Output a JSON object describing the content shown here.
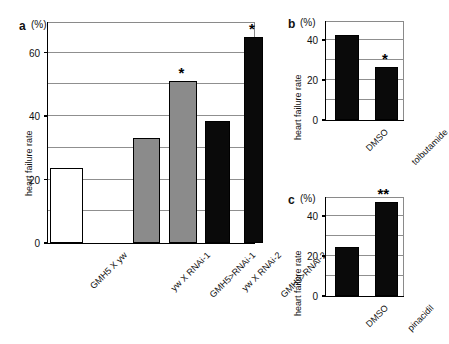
{
  "figure": {
    "panels": [
      {
        "letter": "a",
        "unit": "(%)",
        "ylabel": "heart failure rate",
        "yticks": [
          "0",
          "20",
          "40",
          "60"
        ],
        "bars": [
          {
            "label": "GMH5 X yw",
            "value": 23.5,
            "fill": "white",
            "marker": ""
          },
          {
            "label": "yw X RNAi-1",
            "value": 33.0,
            "fill": "gray",
            "marker": ""
          },
          {
            "label": "GMH5>RNAi-1",
            "value": 51.0,
            "fill": "gray",
            "marker": "*"
          },
          {
            "label": "yw X RNAi-2",
            "value": 38.5,
            "fill": "black",
            "marker": ""
          },
          {
            "label": "GMH5>RNAi-2",
            "value": 65.0,
            "fill": "black",
            "marker": "*"
          }
        ]
      },
      {
        "letter": "b",
        "unit": "(%)",
        "ylabel": "heart failure rate",
        "yticks": [
          "0",
          "20",
          "40"
        ],
        "bars": [
          {
            "label": "DMSO",
            "value": 42.5,
            "fill": "black",
            "marker": ""
          },
          {
            "label": "tolbutamide",
            "value": 26.5,
            "fill": "black",
            "marker": "*"
          }
        ]
      },
      {
        "letter": "c",
        "unit": "(%)",
        "ylabel": "heart failure rate",
        "yticks": [
          "0",
          "20",
          "40"
        ],
        "bars": [
          {
            "label": "DMSO",
            "value": 24.5,
            "fill": "black",
            "marker": ""
          },
          {
            "label": "pinacidil",
            "value": 47.0,
            "fill": "black",
            "marker": "**"
          }
        ]
      }
    ]
  },
  "chart_data": [
    {
      "type": "bar",
      "panel": "a",
      "title": "",
      "xlabel": "",
      "ylabel": "heart failure rate",
      "yunit": "(%)",
      "ylim": [
        0,
        70
      ],
      "ytick_values": [
        0,
        20,
        40,
        60
      ],
      "gridlines": [
        10,
        20,
        30,
        40,
        50,
        60,
        70
      ],
      "grid": true,
      "legend": "none",
      "categories": [
        "GMH5 X yw",
        "yw X RNAi-1",
        "GMH5>RNAi-1",
        "yw X RNAi-2",
        "GMH5>RNAi-2"
      ],
      "values": [
        23.5,
        33.0,
        51.0,
        38.5,
        65.0
      ],
      "bar_colors": [
        "#ffffff",
        "#8b8b8b",
        "#8b8b8b",
        "#0a0a0a",
        "#0a0a0a"
      ],
      "annotations": [
        {
          "category": "GMH5>RNAi-1",
          "text": "*"
        },
        {
          "category": "GMH5>RNAi-2",
          "text": "*"
        }
      ]
    },
    {
      "type": "bar",
      "panel": "b",
      "title": "",
      "xlabel": "",
      "ylabel": "heart failure rate",
      "yunit": "(%)",
      "ylim": [
        0,
        50
      ],
      "ytick_values": [
        0,
        20,
        40
      ],
      "gridlines": [
        10,
        20,
        30,
        40,
        50
      ],
      "grid": true,
      "legend": "none",
      "categories": [
        "DMSO",
        "tolbutamide"
      ],
      "values": [
        42.5,
        26.5
      ],
      "bar_colors": [
        "#0a0a0a",
        "#0a0a0a"
      ],
      "annotations": [
        {
          "category": "tolbutamide",
          "text": "*"
        }
      ]
    },
    {
      "type": "bar",
      "panel": "c",
      "title": "",
      "xlabel": "",
      "ylabel": "heart failure rate",
      "yunit": "(%)",
      "ylim": [
        0,
        50
      ],
      "ytick_values": [
        0,
        20,
        40
      ],
      "gridlines": [
        10,
        20,
        30,
        40,
        50
      ],
      "grid": true,
      "legend": "none",
      "categories": [
        "DMSO",
        "pinacidil"
      ],
      "values": [
        24.5,
        47.0
      ],
      "bar_colors": [
        "#0a0a0a",
        "#0a0a0a"
      ],
      "annotations": [
        {
          "category": "pinacidil",
          "text": "**"
        }
      ]
    }
  ]
}
